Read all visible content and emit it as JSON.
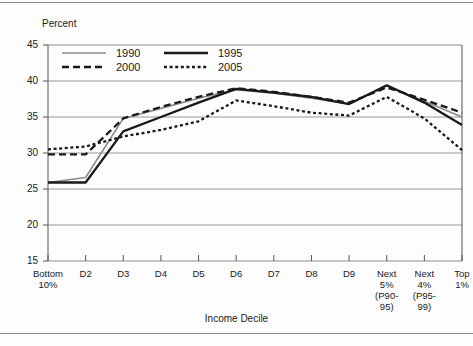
{
  "figure": {
    "y_axis_title": "Percent",
    "x_axis_title": "Income Decile"
  },
  "chart_data": {
    "type": "line",
    "title": "",
    "xlabel": "Income Decile",
    "ylabel": "Percent",
    "ylim": [
      15,
      45
    ],
    "yticks": [
      15,
      20,
      25,
      30,
      35,
      40,
      45
    ],
    "grid": true,
    "legend_position": "top-left-inside",
    "categories": [
      "Bottom\n10%",
      "D2",
      "D3",
      "D4",
      "D5",
      "D6",
      "D7",
      "D8",
      "D9",
      "Next\n5%\n(P90-\n95)",
      "Next\n4%\n(P95-\n99)",
      "Top\n1%"
    ],
    "series": [
      {
        "name": "1990",
        "style": "solid-thin-gray",
        "color": "#8a8a8a",
        "values": [
          25.9,
          26.6,
          34.8,
          36.2,
          37.6,
          38.8,
          38.3,
          37.6,
          36.8,
          39.3,
          37.2,
          35.0
        ]
      },
      {
        "name": "1995",
        "style": "solid-thick-black",
        "color": "#1a1a1a",
        "values": [
          25.9,
          25.9,
          33.0,
          35.0,
          37.0,
          38.9,
          38.4,
          37.8,
          36.8,
          39.4,
          37.0,
          33.9
        ]
      },
      {
        "name": "2000",
        "style": "dashed-black",
        "color": "#1a1a1a",
        "values": [
          29.8,
          29.8,
          34.8,
          36.4,
          37.8,
          39.0,
          38.5,
          37.8,
          37.0,
          39.1,
          37.4,
          35.6
        ]
      },
      {
        "name": "2005",
        "style": "dotted-black",
        "color": "#1a1a1a",
        "values": [
          30.5,
          30.9,
          32.3,
          33.2,
          34.4,
          37.3,
          36.5,
          35.6,
          35.2,
          37.8,
          34.8,
          30.4
        ]
      }
    ]
  },
  "legend": {
    "entries": [
      {
        "label": "1990"
      },
      {
        "label": "1995"
      },
      {
        "label": "2000"
      },
      {
        "label": "2005"
      }
    ]
  }
}
